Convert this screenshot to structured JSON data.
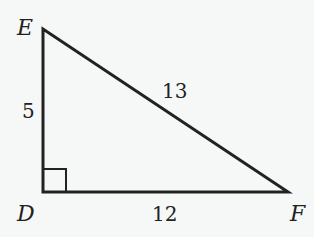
{
  "diagram": {
    "type": "right-triangle",
    "vertices": {
      "E": "E",
      "D": "D",
      "F": "F"
    },
    "sides": {
      "DE": "5",
      "EF": "13",
      "DF": "12"
    },
    "right_angle_at": "D",
    "colors": {
      "stroke": "#222222",
      "background": "#f6f8f7"
    }
  }
}
